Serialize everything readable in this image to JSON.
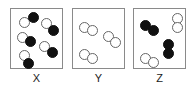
{
  "panels": [
    {
      "label": "X",
      "left": 10,
      "molecules": [
        {
          "balls": [
            {
              "x": 8,
              "y": 8,
              "type": "open"
            },
            {
              "x": 17,
              "y": 3,
              "type": "filled"
            }
          ]
        },
        {
          "balls": [
            {
              "x": 30,
              "y": 9,
              "type": "open"
            },
            {
              "x": 37,
              "y": 16,
              "type": "filled"
            }
          ]
        },
        {
          "balls": [
            {
              "x": 6,
              "y": 23,
              "type": "open"
            },
            {
              "x": 14,
              "y": 27,
              "type": "filled"
            }
          ]
        },
        {
          "balls": [
            {
              "x": 28,
              "y": 32,
              "type": "open"
            },
            {
              "x": 36,
              "y": 38,
              "type": "filled"
            }
          ]
        },
        {
          "balls": [
            {
              "x": 8,
              "y": 41,
              "type": "open"
            },
            {
              "x": 12,
              "y": 49,
              "type": "filled"
            }
          ]
        }
      ]
    },
    {
      "label": "Y",
      "left": 72,
      "molecules": [
        {
          "balls": [
            {
              "x": 6,
              "y": 13,
              "type": "open"
            },
            {
              "x": 14,
              "y": 16,
              "type": "open"
            }
          ]
        },
        {
          "balls": [
            {
              "x": 30,
              "y": 22,
              "type": "open"
            },
            {
              "x": 37,
              "y": 28,
              "type": "open"
            }
          ]
        },
        {
          "balls": [
            {
              "x": 6,
              "y": 40,
              "type": "open"
            },
            {
              "x": 14,
              "y": 44,
              "type": "open"
            }
          ]
        }
      ]
    },
    {
      "label": "Z",
      "left": 133,
      "molecules": [
        {
          "balls": [
            {
              "x": 6,
              "y": 11,
              "type": "filled"
            },
            {
              "x": 14,
              "y": 16,
              "type": "filled"
            }
          ]
        },
        {
          "balls": [
            {
              "x": 38,
              "y": 4,
              "type": "open"
            },
            {
              "x": 38,
              "y": 13,
              "type": "open"
            }
          ]
        },
        {
          "balls": [
            {
              "x": 29,
              "y": 30,
              "type": "filled"
            },
            {
              "x": 29,
              "y": 39,
              "type": "filled"
            }
          ]
        },
        {
          "balls": [
            {
              "x": 6,
              "y": 44,
              "type": "open"
            },
            {
              "x": 14,
              "y": 48,
              "type": "open"
            }
          ]
        }
      ]
    }
  ]
}
